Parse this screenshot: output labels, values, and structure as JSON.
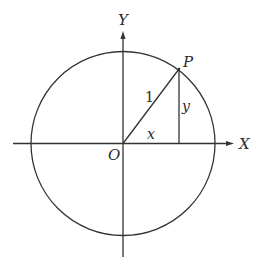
{
  "diagram": {
    "type": "unit-circle",
    "colors": {
      "stroke": "#333333",
      "text": "#2a2a2a",
      "background": "#ffffff"
    },
    "labels": {
      "y_axis": "Y",
      "x_axis": "X",
      "origin": "O",
      "point": "P",
      "radius": "1",
      "x_leg": "x",
      "y_leg": "y"
    }
  }
}
